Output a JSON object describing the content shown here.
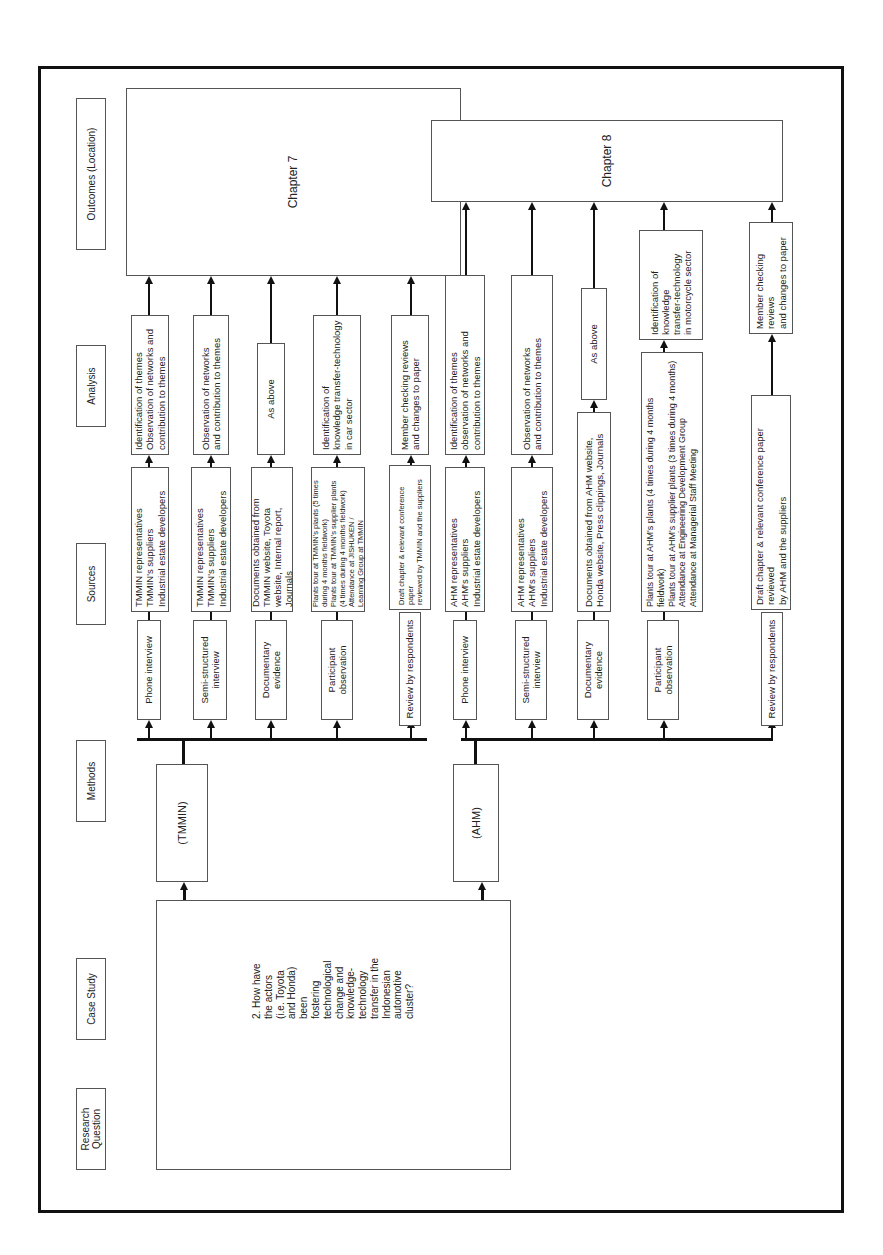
{
  "headers": {
    "research_question": "Research\nQuestion",
    "case_study": "Case Study",
    "methods": "Methods",
    "sources": "Sources",
    "analysis": "Analysis",
    "outcomes": "Outcomes (Location)"
  },
  "research_question": "2. How have\nthe actors\n(i.e. Toyota\nand Honda)\nbeen\nfostering\ntechnological\nchange and\nknowledge-\ntechnology\ntransfer in the\nIndonesian\nautomotive\ncluster?",
  "cases": [
    {
      "name": "(TMMIN)",
      "methods": [
        "Phone interview",
        "Semi-structured\ninterview",
        "Documentary\nevidence",
        "Participant\nobservation",
        "Review by respondents"
      ],
      "sources": [
        "TMMIN representatives\nTMMIN's suppliers\nIndustrial estate developers",
        "TMMIN representatives\nTMMIN's suppliers\nIndustrial estate developers",
        "Documents obtained from\nTMMIN website, Toyota\nwebsite, Internal report, Journals",
        "Plants tour at TMMIN's plants (5 times\nduring 4 months fieldwork)\nPlants tour at TMMIN's supplier plants\n(4 times during 4 months fieldwork)\nAttendance at JISHUKEN /\nLearning Group at TMMIN",
        "Draft chapter & relevant conference paper\nreviewed by TMMIN and the suppliers"
      ],
      "analysis": [
        "Identification of themes\nObservation of networks and\ncontribution to themes",
        "Observation of networks\nand contribution to themes",
        "As above",
        "Identification of\nknowledge transfer-technology\nin car sector",
        "Member checking reviews\nand changes to paper"
      ],
      "outcome": "Chapter 7"
    },
    {
      "name": "(AHM)",
      "methods": [
        "Phone interview",
        "Semi-structured\ninterview",
        "Documentary\nevidence",
        "Participant\nobservation",
        "Review by respondents"
      ],
      "sources": [
        "AHM representatives\nAHM's suppliers\nIndustrial estate developers",
        "AHM representatives\nAHM's suppliers\nIndustrial estate developers",
        "Documents obtained from AHM website,\nHonda website, Press clippings, Journals",
        "Plants tour at AHM's plants (4 times during 4 months fieldwork)\nPlants tour at AHM's supplier plants (3 times during 4 months)\nAttendance at Engineering Development Group\nAttendance at Managerial Staff Meeting",
        "Draft chapter & relevant conference paper reviewed\nby AHM and the suppliers"
      ],
      "analysis": [
        "Identification of themes\nobservation of networks and\ncontribution to themes",
        "Observation of networks\nand contribution to themes",
        "As above",
        "Identification of knowledge\ntransfer-technology\nin motorcycle sector",
        "Member checking reviews\nand changes to paper"
      ],
      "outcome": "Chapter 8"
    }
  ],
  "caption": ""
}
